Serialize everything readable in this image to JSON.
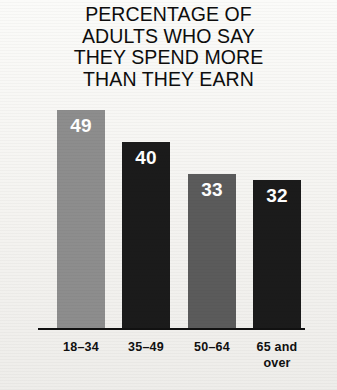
{
  "chart_data": {
    "type": "bar",
    "title": "PERCENTAGE OF ADULTS WHO SAY THEY SPEND MORE THAN THEY EARN",
    "title_lines": [
      "PERCENTAGE OF",
      "ADULTS WHO SAY",
      "THEY SPEND MORE",
      "THAN THEY EARN"
    ],
    "categories": [
      "18–34",
      "35–49",
      "50–64",
      "65 and over"
    ],
    "values": [
      49,
      40,
      33,
      32
    ],
    "value_labels": [
      "49",
      "40",
      "33",
      "32"
    ],
    "xlabel": "",
    "ylabel": "",
    "ylim": [
      0,
      55
    ],
    "grid": false,
    "legend": "none",
    "bar_colors": [
      "#8d8d8d",
      "#1b1b1b",
      "#5b5b5b",
      "#1b1b1b"
    ],
    "value_label_color": "#ffffff",
    "axis_color": "#111111",
    "background_color": "#f6f5f2",
    "title_color": "#0d0d0d"
  },
  "axis": {
    "baseline_name": "x-axis-baseline"
  },
  "bars": [
    {
      "category": "18–34",
      "category_lines": [
        "18–34"
      ],
      "value": "49",
      "color": "#8d8d8d",
      "left": 57,
      "width": 48,
      "height": 218
    },
    {
      "category": "35–49",
      "category_lines": [
        "35–49"
      ],
      "value": "40",
      "color": "#1b1b1b",
      "left": 122,
      "width": 48,
      "height": 186
    },
    {
      "category": "50–64",
      "category_lines": [
        "50–64"
      ],
      "value": "33",
      "color": "#5b5b5b",
      "left": 188,
      "width": 48,
      "height": 154
    },
    {
      "category": "65 and over",
      "category_lines": [
        "65 and",
        "over"
      ],
      "value": "32",
      "color": "#1b1b1b",
      "left": 253,
      "width": 48,
      "height": 148
    }
  ]
}
